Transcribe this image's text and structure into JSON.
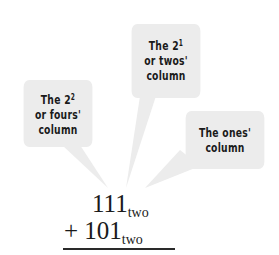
{
  "bubbles": {
    "fours": {
      "line1": "The 2",
      "exp": "2",
      "line2": "or fours'",
      "line3": "column"
    },
    "twos": {
      "line1": "The 2",
      "exp": "1",
      "line2": "or twos'",
      "line3": "column"
    },
    "ones": {
      "line1": "The ones'",
      "line2": "column"
    }
  },
  "addition": {
    "addend1": {
      "digits": "111",
      "base": "two"
    },
    "operator": "+",
    "addend2": {
      "digits": "101",
      "base": "two"
    }
  },
  "colors": {
    "bubble_fill": "#ececec",
    "text": "#1a1a1a",
    "background": "#ffffff"
  }
}
